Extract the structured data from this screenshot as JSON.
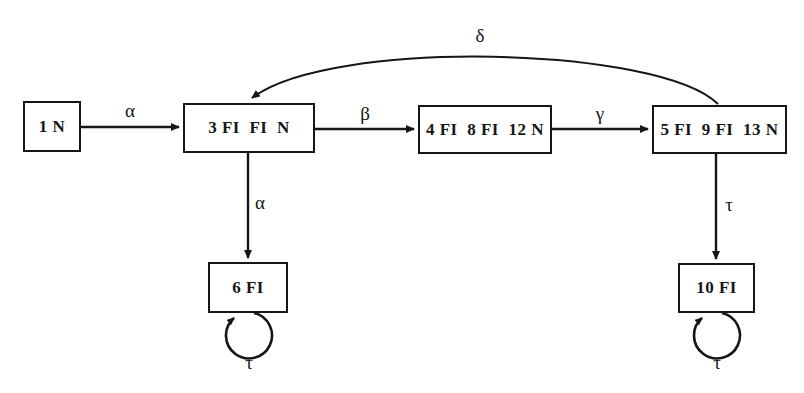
{
  "diagram": {
    "background_color": "#ffffff",
    "stroke_color": "#161616",
    "nodes": [
      {
        "id": "n1",
        "label": "1 N",
        "x": 23,
        "y": 101,
        "w": 58,
        "h": 51
      },
      {
        "id": "n3",
        "label": "3 FI  FI  N",
        "x": 183,
        "y": 103,
        "w": 132,
        "h": 50
      },
      {
        "id": "n4",
        "label": "4 FI  8 FI  12 N",
        "x": 418,
        "y": 105,
        "w": 134,
        "h": 49
      },
      {
        "id": "n5",
        "label": "5 FI  9 FI  13 N",
        "x": 652,
        "y": 105,
        "w": 135,
        "h": 49
      },
      {
        "id": "n6",
        "label": "6 FI",
        "x": 208,
        "y": 262,
        "w": 80,
        "h": 51
      },
      {
        "id": "n10",
        "label": "10 FI",
        "x": 678,
        "y": 263,
        "w": 77,
        "h": 50
      }
    ],
    "edges": [
      {
        "id": "e-alpha-1-3",
        "label": "α",
        "from": "n1",
        "to": "n3",
        "kind": "horizontal",
        "label_x": 130,
        "label_y": 101
      },
      {
        "id": "e-beta-3-4",
        "label": "β",
        "from": "n3",
        "to": "n4",
        "kind": "horizontal",
        "label_x": 365,
        "label_y": 104
      },
      {
        "id": "e-gamma-4-5",
        "label": "γ",
        "from": "n4",
        "to": "n5",
        "kind": "horizontal",
        "label_x": 600,
        "label_y": 104
      },
      {
        "id": "e-delta-5-3",
        "label": "δ",
        "from": "n5",
        "to": "n3",
        "kind": "arc",
        "label_x": 480,
        "label_y": 26
      },
      {
        "id": "e-alpha-3-6",
        "label": "α",
        "from": "n3",
        "to": "n6",
        "kind": "vertical",
        "label_x": 258,
        "label_y": 193
      },
      {
        "id": "e-tau-5-10",
        "label": "τ",
        "from": "n5",
        "to": "n10",
        "kind": "vertical",
        "label_x": 727,
        "label_y": 195
      },
      {
        "id": "e-tau-loop-6",
        "label": "τ",
        "from": "n6",
        "to": "n6",
        "kind": "self-loop",
        "label_x": 248,
        "label_y": 357
      },
      {
        "id": "e-tau-loop-10",
        "label": "τ",
        "from": "n10",
        "to": "n10",
        "kind": "self-loop",
        "label_x": 716,
        "label_y": 357
      }
    ]
  }
}
